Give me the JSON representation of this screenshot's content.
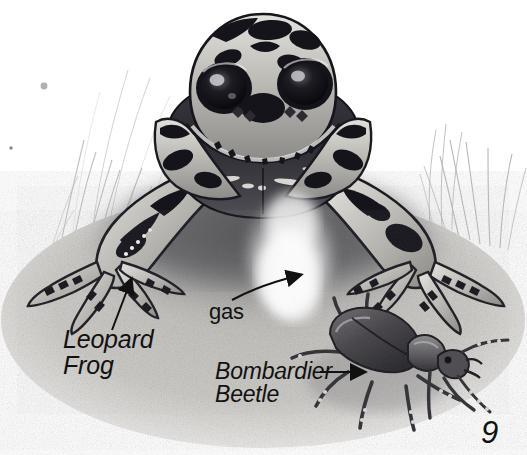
{
  "page": {
    "kind": "illustrated-book-page",
    "background_color": "#ffffff",
    "ink_color": "#111111",
    "page_number": "9"
  },
  "labels": {
    "leopard_frog": "Leopard\nFrog",
    "bombardier_beetle": "Bombardier\nBeetle",
    "gas": "gas"
  },
  "leaders": {
    "leopard_frog_arrow": "straight-arrow-up-right",
    "bombardier_beetle_arrow": "straight-arrow-right",
    "gas_arrow": "curved-arrow-up-right"
  },
  "scene": {
    "subjects": [
      {
        "name": "leopard-frog",
        "description": "Large spotted frog facing viewer, front legs splayed, webbed toes",
        "palette": {
          "skin_light": "#d8d6d2",
          "skin_mid": "#9a9893",
          "spot_dark": "#15141a",
          "belly_dark": "#2c2b31",
          "eye_dark": "#0c0b10"
        }
      },
      {
        "name": "bombardier-beetle",
        "description": "Dark beetle on the ground at lower right, long legs and antennae",
        "palette": {
          "elytra": "#4a484c",
          "elytra_dark": "#232227",
          "legs": "#3c3a3e"
        }
      },
      {
        "name": "defensive-gas-plume",
        "description": "Bright white vapour spray rising from the beetle toward the frog",
        "palette": {
          "plume": "#ffffff"
        }
      },
      {
        "name": "ground",
        "description": "Stippled sandy soil with cast shadow under frog",
        "palette": {
          "soil_light": "#cfcdc8",
          "soil_mid": "#8e8c88",
          "soil_dark": "#56555a"
        }
      },
      {
        "name": "grass",
        "description": "Faint pencil grass blades at left and right edges",
        "palette": {
          "grass": "#b9b8b4"
        }
      }
    ]
  }
}
